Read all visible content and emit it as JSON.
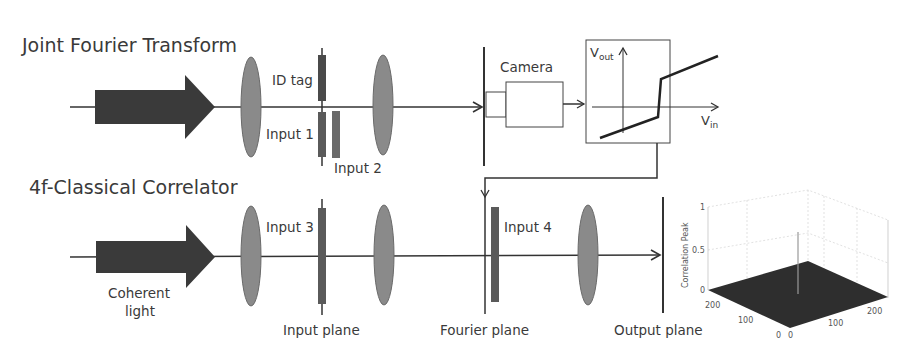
{
  "titles": {
    "top": "Joint Fourier Transform",
    "bottom": "4f-Classical Correlator"
  },
  "top_path": {
    "labels": {
      "id_tag": "ID tag",
      "input1": "Input 1",
      "input2": "Input 2",
      "camera": "Camera"
    },
    "transfer_function": {
      "y_label": "V",
      "y_sub": "out",
      "x_label": "V",
      "x_sub": "in"
    }
  },
  "bottom_path": {
    "labels": {
      "source": "Coherent",
      "source2": "light",
      "input3": "Input 3",
      "input4": "Input 4",
      "input_plane": "Input plane",
      "fourier_plane": "Fourier plane",
      "output_plane": "Output plane"
    }
  },
  "correlation_plot": {
    "z_label": "Correlation Peak",
    "z_ticks": [
      "0",
      "0.5",
      "1"
    ],
    "x_ticks": [
      "0",
      "100",
      "200"
    ],
    "y_ticks": [
      "0",
      "100",
      "200"
    ]
  },
  "colors": {
    "arrow": "#3a3a3a",
    "lens": "#8a8a8a",
    "element": "#5a5a5a",
    "line": "#333333"
  }
}
